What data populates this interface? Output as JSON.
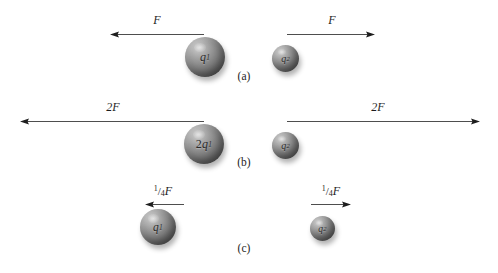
{
  "figure": {
    "background_color": "#ffffff",
    "sphere_color": "#7d7d7d",
    "line_color": "#3a3a3a",
    "text_color": "#1d1d1d",
    "rows": [
      {
        "caption": "(a)",
        "caption_x": 244,
        "caption_y": 70,
        "left": {
          "charge_label_main": "q",
          "charge_label_sub": "1",
          "charge_full": "q1",
          "sphere_x": 205,
          "sphere_y": 57,
          "sphere_d": 40,
          "force_label": "F",
          "force_label_x": 157,
          "force_label_y": 13,
          "arrow_x": 110,
          "arrow_y": 30,
          "arrow_len": 95,
          "arrow_dir": "left"
        },
        "right": {
          "charge_label_main": "q",
          "charge_label_sub": "2",
          "charge_full": "q2",
          "sphere_x": 285,
          "sphere_y": 58,
          "sphere_d": 27,
          "force_label": "F",
          "force_label_x": 332,
          "force_label_y": 13,
          "arrow_x": 287,
          "arrow_y": 30,
          "arrow_len": 88,
          "arrow_dir": "right"
        }
      },
      {
        "caption": "(b)",
        "caption_x": 244,
        "caption_y": 156,
        "left": {
          "charge_label_prefix": "2",
          "charge_label_main": "q",
          "charge_label_sub": "1",
          "charge_full": "2q1",
          "sphere_x": 204,
          "sphere_y": 144,
          "sphere_d": 40,
          "force_label": "2F",
          "force_label_x": 113,
          "force_label_y": 100,
          "arrow_x": 20,
          "arrow_y": 117,
          "arrow_len": 185,
          "arrow_dir": "left"
        },
        "right": {
          "charge_label_main": "q",
          "charge_label_sub": "2",
          "charge_full": "q2",
          "sphere_x": 285,
          "sphere_y": 145,
          "sphere_d": 27,
          "force_label": "2F",
          "force_label_x": 378,
          "force_label_y": 100,
          "arrow_x": 287,
          "arrow_y": 117,
          "arrow_len": 193,
          "arrow_dir": "right"
        }
      },
      {
        "caption": "(c)",
        "caption_x": 244,
        "caption_y": 242,
        "left": {
          "charge_label_main": "q",
          "charge_label_sub": "1",
          "charge_full": "q1",
          "sphere_x": 158,
          "sphere_y": 227,
          "sphere_d": 36,
          "force_label_numerator": "1",
          "force_label_slash": "/",
          "force_label_denominator": "4",
          "force_label_symbol": "F",
          "force_full": "1/4 F",
          "force_label_x": 163,
          "force_label_y": 185,
          "arrow_x": 145,
          "arrow_y": 200,
          "arrow_len": 40,
          "arrow_dir": "left"
        },
        "right": {
          "charge_label_main": "q",
          "charge_label_sub": "2",
          "charge_full": "q2",
          "sphere_x": 322,
          "sphere_y": 228,
          "sphere_d": 25,
          "force_label_numerator": "1",
          "force_label_slash": "/",
          "force_label_denominator": "4",
          "force_label_symbol": "F",
          "force_full": "1/4 F",
          "force_label_x": 331,
          "force_label_y": 185,
          "arrow_x": 311,
          "arrow_y": 200,
          "arrow_len": 40,
          "arrow_dir": "right"
        }
      }
    ]
  }
}
